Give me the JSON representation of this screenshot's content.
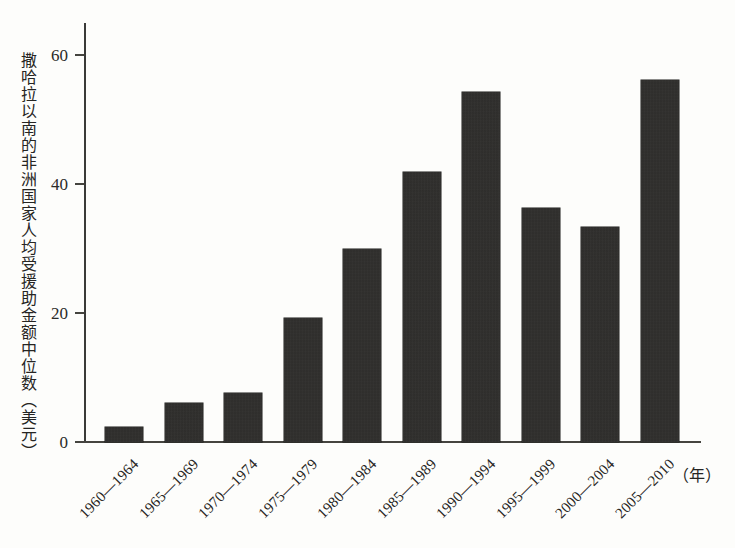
{
  "chart_data": {
    "type": "bar",
    "title": "",
    "subtitle": "",
    "xlabel": "（年）",
    "ylabel": "撒哈拉以南的非洲国家人均受援助金额中位数（美元）",
    "categories": [
      "1960—1964",
      "1965—1969",
      "1970—1974",
      "1975—1979",
      "1980—1984",
      "1985—1989",
      "1990—1994",
      "1995—1999",
      "2000—2004",
      "2005—2010"
    ],
    "values": [
      2.4,
      6.0,
      7.6,
      19.3,
      30.0,
      41.8,
      54.2,
      36.3,
      33.3,
      56.2
    ],
    "ylim": [
      0,
      65
    ],
    "yticks": [
      0,
      20,
      40,
      60
    ],
    "ytick_labels": [
      "0",
      "20",
      "40",
      "60"
    ],
    "grid": false,
    "legend": false,
    "legend_position": "none",
    "bar_color": "#242321",
    "axis_color": "#45443f",
    "background_color": "#fdfdfb"
  },
  "axis": {
    "y_unit_note": "美元",
    "x_unit_note": "年"
  }
}
